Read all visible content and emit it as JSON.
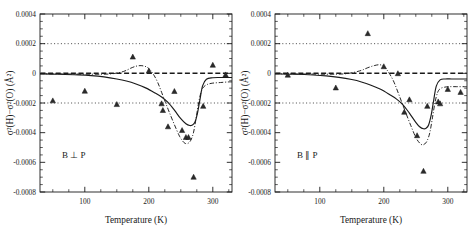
{
  "figure": {
    "panel_count": 2,
    "background": "#ffffff",
    "ink": "#1a1a1a"
  },
  "chart_data": [
    {
      "type": "scatter",
      "panel": "left",
      "title": "",
      "annotation": "B ⊥ P",
      "xlabel": "Temperature (K)",
      "ylabel": "σ²(H)−σ²(O)  (Å²)",
      "xlim": [
        30,
        330
      ],
      "ylim": [
        -0.0008,
        0.0004
      ],
      "xticks": [
        100,
        200,
        300
      ],
      "xticklabels": [
        "100",
        "200",
        "300"
      ],
      "xminor_step": 25,
      "yticks": [
        0.0004,
        0.0002,
        0,
        -0.0002,
        -0.0004,
        -0.0006,
        -0.0008
      ],
      "yticklabels": [
        "0.0004",
        "0.0002",
        "0",
        "-0.0002",
        "-0.0004",
        "-0.0006",
        "-0.0008"
      ],
      "yminor_step": 5e-05,
      "grid": false,
      "legend": null,
      "reference_lines": [
        {
          "y": 0.0002,
          "style": "dotted"
        },
        {
          "y": 0.0,
          "style": "dashed-heavy"
        },
        {
          "y": -0.0002,
          "style": "dotted"
        }
      ],
      "series": [
        {
          "name": "data",
          "marker": "triangle",
          "x": [
            50,
            100,
            150,
            175,
            200,
            220,
            222,
            230,
            240,
            252,
            258,
            262,
            270,
            285,
            300,
            320
          ],
          "y": [
            -0.000185,
            -0.00012,
            -0.00021,
            0.00011,
            1.5e-05,
            -0.000205,
            -0.00025,
            -0.00036,
            -0.000122,
            -0.000385,
            -0.000432,
            -0.000432,
            -0.0007,
            -0.000222,
            5.5e-05,
            -1e-05
          ]
        },
        {
          "name": "solid-model",
          "style": "solid",
          "x": [
            30,
            60,
            90,
            110,
            130,
            150,
            165,
            180,
            195,
            210,
            220,
            230,
            240,
            250,
            258,
            264,
            268,
            272,
            276,
            280,
            284,
            290,
            300,
            310,
            320,
            330
          ],
          "y": [
            -4e-06,
            -6e-06,
            -1e-05,
            -1.5e-05,
            -2.4e-05,
            -3.8e-05,
            -5.2e-05,
            -7.2e-05,
            -9.8e-05,
            -0.000133,
            -0.00016,
            -0.000196,
            -0.000248,
            -0.000306,
            -0.00034,
            -0.000352,
            -0.000348,
            -0.00033,
            -0.00027,
            -0.000175,
            -8.5e-05,
            -4e-05,
            -3e-05,
            -2.8e-05,
            -2.8e-05,
            -2.8e-05
          ]
        },
        {
          "name": "dashdot-model",
          "style": "dashdot",
          "x": [
            30,
            70,
            110,
            140,
            160,
            172,
            180,
            188,
            196,
            202,
            208,
            214,
            220,
            226,
            232,
            240,
            248,
            254,
            258,
            262,
            266,
            270,
            274,
            278,
            282,
            286,
            292,
            300,
            312,
            324,
            330
          ],
          "y": [
            -3e-06,
            -4e-06,
            -6e-06,
            -4e-06,
            1.2e-05,
            3.5e-05,
            4.8e-05,
            5.2e-05,
            4.4e-05,
            2.4e-05,
            -1.2e-05,
            -6.2e-05,
            -0.000128,
            -0.000196,
            -0.000262,
            -0.000346,
            -0.000424,
            -0.000462,
            -0.000474,
            -0.00047,
            -0.000448,
            -0.000396,
            -0.0003,
            -0.000195,
            -0.000122,
            -9e-05,
            -7.4e-05,
            -6.6e-05,
            -6.2e-05,
            -5.8e-05,
            -5.8e-05
          ]
        }
      ]
    },
    {
      "type": "scatter",
      "panel": "right",
      "title": "",
      "annotation": "B ∥ P",
      "xlabel": "Temperature (K)",
      "ylabel": "σ²(H)−σ²(O)  (Å²)",
      "xlim": [
        30,
        330
      ],
      "ylim": [
        -0.0008,
        0.0004
      ],
      "xticks": [
        100,
        200,
        300
      ],
      "xticklabels": [
        "100",
        "200",
        "300"
      ],
      "xminor_step": 25,
      "yticks": [
        0.0004,
        0.0002,
        0,
        -0.0002,
        -0.0004,
        -0.0006,
        -0.0008
      ],
      "yticklabels": [
        "0.0004",
        "0.0002",
        "0",
        "-0.0002",
        "-0.0004",
        "-0.0006",
        "-0.0008"
      ],
      "yminor_step": 5e-05,
      "grid": false,
      "legend": null,
      "reference_lines": [
        {
          "y": 0.0002,
          "style": "dotted"
        },
        {
          "y": 0.0,
          "style": "dashed-heavy"
        },
        {
          "y": -0.0002,
          "style": "dotted"
        }
      ],
      "series": [
        {
          "name": "data",
          "marker": "triangle",
          "x": [
            50,
            125,
            175,
            200,
            222,
            232,
            240,
            252,
            262,
            268,
            285,
            288,
            300,
            320
          ],
          "y": [
            -1.2e-05,
            -9.8e-05,
            0.000268,
            4.5e-05,
            -2e-06,
            -0.000262,
            -0.000178,
            -0.00042,
            -0.00066,
            -0.000222,
            -0.000192,
            -0.000205,
            -0.000108,
            -0.000128
          ]
        },
        {
          "name": "solid-model",
          "style": "solid",
          "x": [
            30,
            60,
            90,
            110,
            130,
            150,
            165,
            180,
            195,
            210,
            220,
            230,
            240,
            250,
            256,
            262,
            266,
            270,
            274,
            278,
            282,
            288,
            296,
            306,
            318,
            330
          ],
          "y": [
            -4e-06,
            -6e-06,
            -1.1e-05,
            -1.7e-05,
            -2.7e-05,
            -4.2e-05,
            -5.8e-05,
            -8e-05,
            -0.000108,
            -0.000146,
            -0.000174,
            -0.000212,
            -0.000268,
            -0.00033,
            -0.00036,
            -0.000374,
            -0.00037,
            -0.000348,
            -0.000282,
            -0.00018,
            -8.6e-05,
            -4.4e-05,
            -3.8e-05,
            -3.8e-05,
            -3.8e-05,
            -3.8e-05
          ]
        },
        {
          "name": "dashdot-model",
          "style": "dashdot",
          "x": [
            30,
            70,
            110,
            140,
            162,
            175,
            185,
            193,
            199,
            204,
            210,
            216,
            222,
            228,
            234,
            242,
            250,
            256,
            260,
            264,
            268,
            272,
            276,
            280,
            284,
            288,
            294,
            302,
            314,
            326,
            330
          ],
          "y": [
            -3e-06,
            -4e-06,
            -6e-06,
            -3e-06,
            1.6e-05,
            3.8e-05,
            5.2e-05,
            5.8e-05,
            5e-05,
            2.8e-05,
            -1e-05,
            -6e-05,
            -0.000126,
            -0.000194,
            -0.000262,
            -0.00035,
            -0.000432,
            -0.00047,
            -0.000482,
            -0.000476,
            -0.000452,
            -0.000398,
            -0.0003,
            -0.000196,
            -0.00013,
            -0.000104,
            -9.4e-05,
            -9e-05,
            -9e-05,
            -9e-05,
            -9e-05
          ]
        }
      ]
    }
  ]
}
